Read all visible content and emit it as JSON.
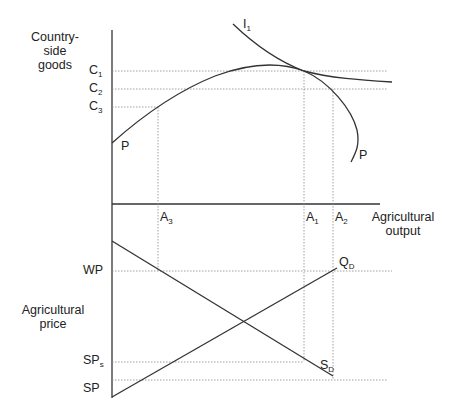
{
  "diagram": {
    "type": "economics-two-panel",
    "top_panel": {
      "y_axis_label": [
        "Country-",
        "side",
        "goods"
      ],
      "y_ticks": [
        {
          "main": "C",
          "sub": "1"
        },
        {
          "main": "C",
          "sub": "2"
        },
        {
          "main": "C",
          "sub": "3"
        }
      ],
      "curves": {
        "ppf_label_left": "P",
        "ppf_label_right": "P",
        "indifference": {
          "main": "I",
          "sub": "1"
        }
      }
    },
    "x_axis": {
      "label": [
        "Agricultural",
        "output"
      ],
      "ticks": [
        {
          "main": "A",
          "sub": "3"
        },
        {
          "main": "A",
          "sub": "1"
        },
        {
          "main": "A",
          "sub": "2"
        }
      ]
    },
    "bottom_panel": {
      "y_axis_label": [
        "Agricultural",
        "price"
      ],
      "y_ticks": [
        {
          "main": "WP",
          "sub": ""
        },
        {
          "main": "SP",
          "sub": "s"
        },
        {
          "main": "SP",
          "sub": ""
        }
      ],
      "lines": {
        "supply": {
          "main": "Q",
          "sub": "D"
        },
        "demand": {
          "main": "S",
          "sub": "D"
        }
      }
    },
    "colors": {
      "line": "#333333",
      "dotted": "#888888"
    }
  }
}
